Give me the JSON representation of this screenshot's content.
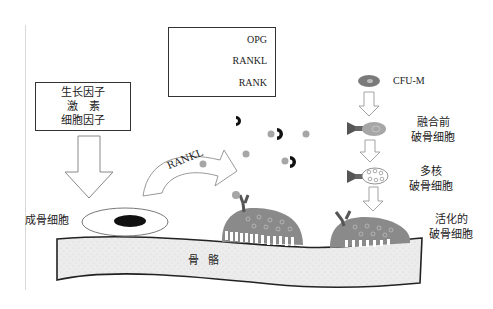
{
  "legend": {
    "items": [
      {
        "icon": "opg-c-shape",
        "label": "OPG"
      },
      {
        "icon": "rankl-gray-dot",
        "label": "RANKL"
      },
      {
        "icon": "rank-receptor-y-shape",
        "label": "RANK"
      }
    ]
  },
  "factors_box": {
    "lines": [
      "生长因子",
      "激　素",
      "细胞因子"
    ]
  },
  "labels": {
    "osteoblast": "成骨细胞",
    "bone": "骨 骼",
    "rankl_arrow": "RANKL",
    "cfu_m": "CFU-M",
    "pre_fusion_osteoclast": [
      "融合前",
      "破骨细胞"
    ],
    "multinucleated_osteoclast": [
      "多核",
      "破骨细胞"
    ],
    "activated_osteoclast": [
      "活化的",
      "破骨细胞"
    ]
  },
  "colors": {
    "bone_fill": "#ececec",
    "osteoclast_fill": "#8a8a8a",
    "rankl_dot": "#a6a6a6",
    "opg": "#111111",
    "rank": "#6a6a6a",
    "cfu_m": "#7a7a7a"
  }
}
